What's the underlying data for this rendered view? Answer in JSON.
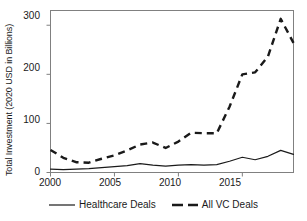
{
  "chart_data": {
    "type": "line",
    "title": "",
    "xlabel": "",
    "ylabel": "Total Investment (2020 USD in Billions)",
    "xlim": [
      2000,
      2019
    ],
    "ylim": [
      0,
      330
    ],
    "grid": false,
    "legend_position": "bottom",
    "x": [
      2000,
      2001,
      2002,
      2003,
      2004,
      2005,
      2006,
      2007,
      2008,
      2009,
      2010,
      2011,
      2012,
      2013,
      2014,
      2015,
      2016,
      2017,
      2018,
      2019
    ],
    "xticks": [
      2000,
      2005,
      2010,
      2015
    ],
    "yticks": [
      0,
      100,
      200,
      300
    ],
    "series": [
      {
        "name": "Healthcare Deals",
        "style": "solid",
        "color": "#1a1a1a",
        "values": [
          7,
          6,
          7,
          8,
          10,
          12,
          14,
          18,
          15,
          13,
          15,
          16,
          15,
          16,
          23,
          31,
          26,
          33,
          45,
          37
        ]
      },
      {
        "name": "All VC Deals",
        "style": "dashed",
        "color": "#1a1a1a",
        "values": [
          46,
          30,
          21,
          20,
          28,
          35,
          45,
          57,
          61,
          50,
          63,
          81,
          80,
          80,
          134,
          200,
          204,
          236,
          313,
          264
        ]
      }
    ]
  },
  "axis": {
    "y_title": "Total Investment (2020 USD in Billions)",
    "y_ticks": [
      {
        "label": "300",
        "value": 300
      },
      {
        "label": "200",
        "value": 200
      },
      {
        "label": "100",
        "value": 100
      },
      {
        "label": "0",
        "value": 0
      }
    ],
    "x_ticks": [
      {
        "label": "2000",
        "value": 2000
      },
      {
        "label": "2005",
        "value": 2005
      },
      {
        "label": "2010",
        "value": 2010
      },
      {
        "label": "2015",
        "value": 2015
      }
    ]
  },
  "legend": {
    "entries": [
      {
        "label": "Healthcare Deals",
        "style": "solid"
      },
      {
        "label": "All VC Deals",
        "style": "dashed"
      }
    ]
  },
  "colors": {
    "line": "#1a1a1a",
    "frame": "#808080",
    "background": "#ffffff"
  }
}
